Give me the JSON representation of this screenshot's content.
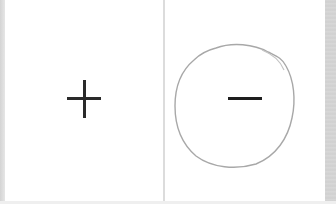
{
  "panels": [
    {
      "id": "left",
      "symbol": "+",
      "symbol_name": "plus",
      "circled": false
    },
    {
      "id": "right",
      "symbol": "−",
      "symbol_name": "minus",
      "circled": true,
      "annotation": "hand-drawn circle"
    }
  ],
  "colors": {
    "background": "#ffffff",
    "symbol": "#2a2a2a",
    "circle_stroke": "#a8a8a8",
    "divider": "#dcdcdc",
    "edge": "#d4d4d4"
  }
}
